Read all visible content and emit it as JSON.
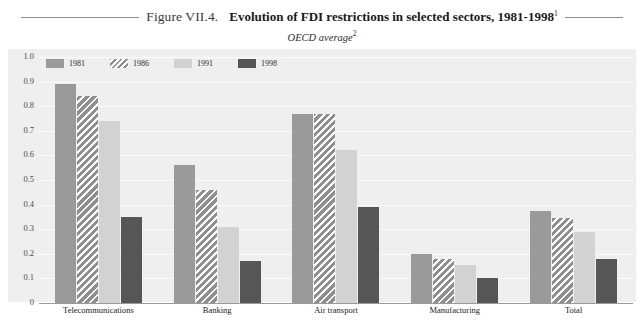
{
  "header": {
    "figure_number": "Figure VII.4.",
    "title": "Evolution of FDI restrictions in selected sectors, 1981-1998",
    "title_superscript": "1",
    "subtitle": "OECD average",
    "subtitle_superscript": "2"
  },
  "legend": {
    "items": [
      {
        "label": "1981",
        "color": "#9a9a9a",
        "pattern": "solid"
      },
      {
        "label": "1986",
        "color": "#9a9a9a",
        "pattern": "diagonal-hatch"
      },
      {
        "label": "1991",
        "color": "#d2d2d2",
        "pattern": "solid"
      },
      {
        "label": "1998",
        "color": "#565656",
        "pattern": "solid"
      }
    ]
  },
  "axis": {
    "y_ticks": [
      "1.0",
      "0.9",
      "0.8",
      "0.7",
      "0.6",
      "0.5",
      "0.4",
      "0.3",
      "0.2",
      "0.1",
      "0"
    ]
  },
  "chart_data": {
    "type": "bar",
    "title": "Evolution of FDI restrictions in selected sectors, 1981-1998",
    "subtitle": "OECD average",
    "xlabel": "",
    "ylabel": "",
    "ylim": [
      0,
      1.0
    ],
    "ytick_step": 0.1,
    "grid": true,
    "legend_position": "top-left",
    "categories": [
      "Telecommunications",
      "Banking",
      "Air transport",
      "Manufacturing",
      "Total"
    ],
    "series": [
      {
        "name": "1981",
        "values": [
          0.89,
          0.56,
          0.77,
          0.2,
          0.375
        ]
      },
      {
        "name": "1986",
        "values": [
          0.84,
          0.46,
          0.77,
          0.18,
          0.345
        ]
      },
      {
        "name": "1991",
        "values": [
          0.74,
          0.31,
          0.62,
          0.155,
          0.29
        ]
      },
      {
        "name": "1998",
        "values": [
          0.35,
          0.17,
          0.39,
          0.1,
          0.18
        ]
      }
    ]
  }
}
